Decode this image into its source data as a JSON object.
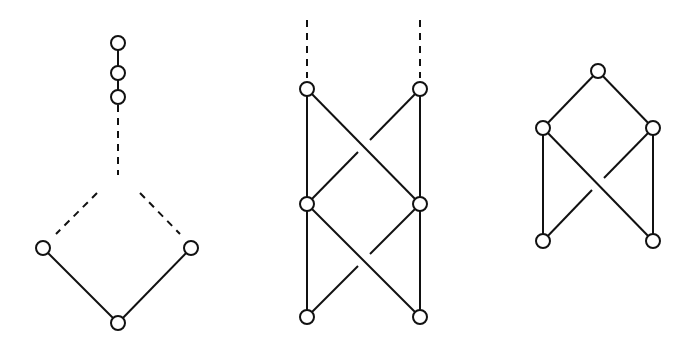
{
  "diagrams": [
    {
      "id": "left-lattice",
      "node_radius": 7,
      "nodes": [
        {
          "id": "c1",
          "x": 118,
          "y": 43
        },
        {
          "id": "c2",
          "x": 118,
          "y": 73
        },
        {
          "id": "c3",
          "x": 118,
          "y": 97
        },
        {
          "id": "l",
          "x": 43,
          "y": 248
        },
        {
          "id": "r",
          "x": 191,
          "y": 248
        },
        {
          "id": "b",
          "x": 118,
          "y": 323
        }
      ],
      "edges": [
        {
          "x1": 118,
          "y1": 43,
          "x2": 118,
          "y2": 73,
          "style": "solid"
        },
        {
          "x1": 118,
          "y1": 73,
          "x2": 118,
          "y2": 97,
          "style": "solid"
        },
        {
          "x1": 118,
          "y1": 105,
          "x2": 118,
          "y2": 175,
          "style": "dashed"
        },
        {
          "x1": 97,
          "y1": 193,
          "x2": 56,
          "y2": 234,
          "style": "dashed"
        },
        {
          "x1": 140,
          "y1": 193,
          "x2": 180,
          "y2": 234,
          "style": "dashed"
        },
        {
          "x1": 43,
          "y1": 248,
          "x2": 118,
          "y2": 323,
          "style": "solid"
        },
        {
          "x1": 191,
          "y1": 248,
          "x2": 118,
          "y2": 323,
          "style": "solid"
        }
      ]
    },
    {
      "id": "middle-lattice",
      "node_radius": 7,
      "nodes": [
        {
          "id": "a1",
          "x": 307,
          "y": 89
        },
        {
          "id": "a2",
          "x": 420,
          "y": 89
        },
        {
          "id": "b1",
          "x": 307,
          "y": 204
        },
        {
          "id": "b2",
          "x": 420,
          "y": 204
        },
        {
          "id": "d1",
          "x": 307,
          "y": 317
        },
        {
          "id": "d2",
          "x": 420,
          "y": 317
        }
      ],
      "edges": [
        {
          "x1": 307,
          "y1": 20,
          "x2": 307,
          "y2": 78,
          "style": "dashed"
        },
        {
          "x1": 420,
          "y1": 20,
          "x2": 420,
          "y2": 78,
          "style": "dashed"
        },
        {
          "x1": 307,
          "y1": 89,
          "x2": 307,
          "y2": 204,
          "style": "solid"
        },
        {
          "x1": 420,
          "y1": 89,
          "x2": 420,
          "y2": 204,
          "style": "solid"
        },
        {
          "x1": 307,
          "y1": 89,
          "x2": 420,
          "y2": 204,
          "style": "solid"
        },
        {
          "x1": 420,
          "y1": 89,
          "x2": 370,
          "y2": 140,
          "style": "solid"
        },
        {
          "x1": 358,
          "y1": 152,
          "x2": 307,
          "y2": 204,
          "style": "solid"
        },
        {
          "x1": 307,
          "y1": 204,
          "x2": 307,
          "y2": 317,
          "style": "solid"
        },
        {
          "x1": 420,
          "y1": 204,
          "x2": 420,
          "y2": 317,
          "style": "solid"
        },
        {
          "x1": 307,
          "y1": 204,
          "x2": 420,
          "y2": 317,
          "style": "solid"
        },
        {
          "x1": 420,
          "y1": 204,
          "x2": 370,
          "y2": 254,
          "style": "solid"
        },
        {
          "x1": 358,
          "y1": 266,
          "x2": 307,
          "y2": 317,
          "style": "solid"
        }
      ]
    },
    {
      "id": "right-lattice",
      "node_radius": 7,
      "nodes": [
        {
          "id": "t",
          "x": 598,
          "y": 71
        },
        {
          "id": "ml",
          "x": 543,
          "y": 128
        },
        {
          "id": "mr",
          "x": 653,
          "y": 128
        },
        {
          "id": "bl",
          "x": 543,
          "y": 241
        },
        {
          "id": "br",
          "x": 653,
          "y": 241
        }
      ],
      "edges": [
        {
          "x1": 598,
          "y1": 71,
          "x2": 543,
          "y2": 128,
          "style": "solid"
        },
        {
          "x1": 598,
          "y1": 71,
          "x2": 653,
          "y2": 128,
          "style": "solid"
        },
        {
          "x1": 543,
          "y1": 128,
          "x2": 543,
          "y2": 241,
          "style": "solid"
        },
        {
          "x1": 653,
          "y1": 128,
          "x2": 653,
          "y2": 241,
          "style": "solid"
        },
        {
          "x1": 543,
          "y1": 128,
          "x2": 653,
          "y2": 241,
          "style": "solid"
        },
        {
          "x1": 653,
          "y1": 128,
          "x2": 604,
          "y2": 178,
          "style": "solid"
        },
        {
          "x1": 592,
          "y1": 190,
          "x2": 543,
          "y2": 241,
          "style": "solid"
        }
      ]
    }
  ]
}
